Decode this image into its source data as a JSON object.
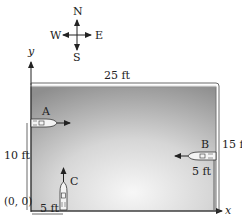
{
  "compass": {
    "north": "N",
    "south": "S",
    "east": "E",
    "west": "W"
  },
  "axes": {
    "x_label": "x",
    "y_label": "y",
    "origin_label": "(0, 0)"
  },
  "pool": {
    "width_label": "25 ft",
    "height_label": "15 ft",
    "fill_dark": "#8a8a8a",
    "fill_light": "#f2f2f2"
  },
  "dimensions": {
    "a_height": "10 ft",
    "b_height": "5 ft",
    "c_offset": "5 ft"
  },
  "boats": [
    {
      "id": "A",
      "label": "A",
      "direction": "east"
    },
    {
      "id": "B",
      "label": "B",
      "direction": "west"
    },
    {
      "id": "C",
      "label": "C",
      "direction": "north"
    }
  ]
}
